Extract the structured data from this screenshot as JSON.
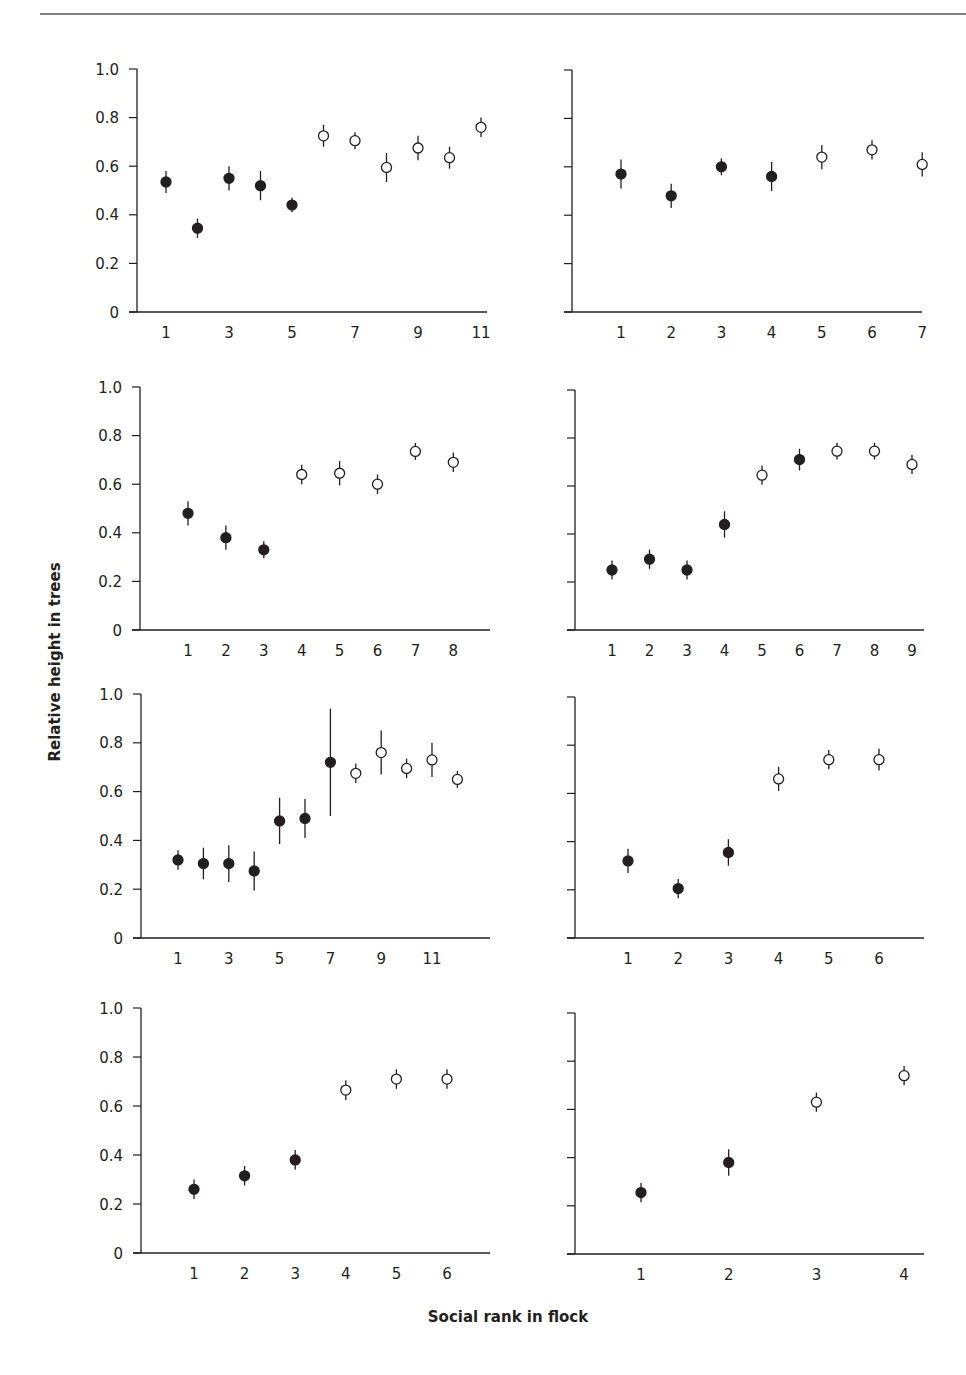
{
  "figure": {
    "ylabel": "Relative height in trees",
    "xlabel": "Social rank in flock",
    "colors": {
      "ink": "#231f20",
      "rule": "#555555",
      "background": "#ffffff"
    },
    "legend_note": "filled = dominant/filled markers, open = open markers"
  },
  "chart_data": [
    {
      "type": "scatter",
      "panel": "top-left",
      "xlabel": "Social rank in flock",
      "ylabel": "Relative height in trees",
      "ylim": [
        0,
        1.0
      ],
      "yticks": [
        "0",
        "0.2",
        "0.4",
        "0.6",
        "0.8",
        "1.0"
      ],
      "show_ytick_labels": true,
      "xtick_labels": [
        "1",
        "3",
        "5",
        "7",
        "9",
        "11"
      ],
      "x": [
        1,
        2,
        3,
        4,
        5,
        6,
        7,
        8,
        9,
        10,
        11
      ],
      "y": [
        0.535,
        0.345,
        0.55,
        0.52,
        0.44,
        0.725,
        0.705,
        0.595,
        0.675,
        0.635,
        0.76
      ],
      "err": [
        0.045,
        0.04,
        0.05,
        0.06,
        0.03,
        0.045,
        0.035,
        0.06,
        0.05,
        0.045,
        0.04
      ],
      "filled": [
        true,
        true,
        true,
        true,
        true,
        false,
        false,
        false,
        false,
        false,
        false
      ],
      "grid": false
    },
    {
      "type": "scatter",
      "panel": "top-right",
      "ylim": [
        0,
        1.0
      ],
      "yticks": [
        "0",
        "0.2",
        "0.4",
        "0.6",
        "0.8",
        "1.0"
      ],
      "show_ytick_labels": false,
      "xtick_labels": [
        "1",
        "2",
        "3",
        "4",
        "5",
        "6",
        "7"
      ],
      "x": [
        1,
        2,
        3,
        4,
        5,
        6,
        7
      ],
      "y": [
        0.57,
        0.48,
        0.6,
        0.56,
        0.64,
        0.67,
        0.61
      ],
      "err": [
        0.06,
        0.05,
        0.035,
        0.06,
        0.05,
        0.04,
        0.05
      ],
      "filled": [
        true,
        true,
        true,
        true,
        false,
        false,
        false
      ],
      "grid": false
    },
    {
      "type": "scatter",
      "panel": "second-left",
      "ylim": [
        0,
        1.0
      ],
      "yticks": [
        "0",
        "0.2",
        "0.4",
        "0.6",
        "0.8",
        "1.0"
      ],
      "show_ytick_labels": true,
      "xtick_labels": [
        "1",
        "2",
        "3",
        "4",
        "5",
        "6",
        "7",
        "8"
      ],
      "x": [
        1,
        2,
        3,
        4,
        5,
        6,
        7,
        8
      ],
      "y": [
        0.48,
        0.38,
        0.33,
        0.64,
        0.645,
        0.6,
        0.735,
        0.69
      ],
      "err": [
        0.05,
        0.05,
        0.035,
        0.04,
        0.05,
        0.04,
        0.035,
        0.04
      ],
      "filled": [
        true,
        true,
        true,
        false,
        false,
        false,
        false,
        false
      ],
      "grid": false
    },
    {
      "type": "scatter",
      "panel": "second-right",
      "ylim": [
        0,
        1.0
      ],
      "yticks": [
        "0",
        "0.2",
        "0.4",
        "0.6",
        "0.8",
        "1.0"
      ],
      "show_ytick_labels": false,
      "xtick_labels": [
        "1",
        "2",
        "3",
        "4",
        "5",
        "6",
        "7",
        "8",
        "9"
      ],
      "x": [
        1,
        2,
        3,
        4,
        5,
        6,
        7,
        8,
        9
      ],
      "y": [
        0.25,
        0.295,
        0.25,
        0.44,
        0.645,
        0.71,
        0.745,
        0.745,
        0.69
      ],
      "err": [
        0.04,
        0.04,
        0.04,
        0.055,
        0.04,
        0.045,
        0.035,
        0.035,
        0.04
      ],
      "filled": [
        true,
        true,
        true,
        true,
        false,
        true,
        false,
        false,
        false
      ],
      "grid": false
    },
    {
      "type": "scatter",
      "panel": "third-left",
      "ylim": [
        0,
        1.0
      ],
      "yticks": [
        "0",
        "0.2",
        "0.4",
        "0.6",
        "0.8",
        "1.0"
      ],
      "show_ytick_labels": true,
      "xtick_labels": [
        "1",
        "3",
        "5",
        "7",
        "9",
        "11"
      ],
      "x": [
        1,
        2,
        3,
        4,
        5,
        6,
        7,
        8,
        9,
        10,
        11,
        12
      ],
      "y": [
        0.32,
        0.305,
        0.305,
        0.275,
        0.48,
        0.49,
        0.72,
        0.675,
        0.76,
        0.695,
        0.73,
        0.65
      ],
      "err": [
        0.04,
        0.065,
        0.075,
        0.08,
        0.095,
        0.08,
        0.22,
        0.04,
        0.09,
        0.04,
        0.07,
        0.035
      ],
      "filled": [
        true,
        true,
        true,
        true,
        true,
        true,
        true,
        false,
        false,
        false,
        false,
        false
      ],
      "grid": false
    },
    {
      "type": "scatter",
      "panel": "third-right",
      "ylim": [
        0,
        1.0
      ],
      "yticks": [
        "0",
        "0.2",
        "0.4",
        "0.6",
        "0.8",
        "1.0"
      ],
      "show_ytick_labels": false,
      "xtick_labels": [
        "1",
        "2",
        "3",
        "4",
        "5",
        "6"
      ],
      "x": [
        1,
        2,
        3,
        4,
        5,
        6
      ],
      "y": [
        0.32,
        0.205,
        0.355,
        0.66,
        0.74,
        0.74
      ],
      "err": [
        0.05,
        0.04,
        0.055,
        0.05,
        0.04,
        0.045
      ],
      "filled": [
        true,
        true,
        true,
        false,
        false,
        false
      ],
      "grid": false
    },
    {
      "type": "scatter",
      "panel": "bottom-left",
      "ylim": [
        0,
        1.0
      ],
      "yticks": [
        "0",
        "0.2",
        "0.4",
        "0.6",
        "0.8",
        "1.0"
      ],
      "show_ytick_labels": true,
      "xtick_labels": [
        "1",
        "2",
        "3",
        "4",
        "5",
        "6"
      ],
      "x": [
        1,
        2,
        3,
        4,
        5,
        6
      ],
      "y": [
        0.26,
        0.315,
        0.38,
        0.665,
        0.71,
        0.71
      ],
      "err": [
        0.04,
        0.04,
        0.04,
        0.04,
        0.04,
        0.04
      ],
      "filled": [
        true,
        true,
        true,
        false,
        false,
        false
      ],
      "grid": false
    },
    {
      "type": "scatter",
      "panel": "bottom-right",
      "ylim": [
        0,
        1.0
      ],
      "yticks": [
        "0",
        "0.2",
        "0.4",
        "0.6",
        "0.8",
        "1.0"
      ],
      "show_ytick_labels": false,
      "xtick_labels": [
        "1",
        "2",
        "3",
        "4"
      ],
      "x": [
        1,
        2,
        3,
        4
      ],
      "y": [
        0.255,
        0.38,
        0.63,
        0.74
      ],
      "err": [
        0.04,
        0.055,
        0.04,
        0.04
      ],
      "filled": [
        true,
        true,
        false,
        false
      ],
      "grid": false
    }
  ],
  "layout": {
    "panels": [
      {
        "axis_x": 137,
        "x_end": 487,
        "y0": 312,
        "y1": 69,
        "first_x": 166,
        "step": 31.5,
        "tick_positions": [
          1,
          3,
          5,
          7,
          9,
          11
        ]
      },
      {
        "axis_x": 572,
        "x_end": 922,
        "y0": 312,
        "y1": 70,
        "first_x": 621,
        "step": 50.2,
        "tick_positions": [
          1,
          2,
          3,
          4,
          5,
          6,
          7
        ]
      },
      {
        "axis_x": 140,
        "x_end": 490,
        "y0": 630,
        "y1": 387,
        "first_x": 188,
        "step": 37.9,
        "tick_positions": [
          1,
          2,
          3,
          4,
          5,
          6,
          7,
          8
        ]
      },
      {
        "axis_x": 575,
        "x_end": 924,
        "y0": 630,
        "y1": 390,
        "first_x": 612,
        "step": 37.5,
        "tick_positions": [
          1,
          2,
          3,
          4,
          5,
          6,
          7,
          8,
          9
        ]
      },
      {
        "axis_x": 141,
        "x_end": 490,
        "y0": 938,
        "y1": 694,
        "first_x": 178,
        "step": 25.4,
        "tick_positions": [
          1,
          3,
          5,
          7,
          9,
          11
        ]
      },
      {
        "axis_x": 575,
        "x_end": 924,
        "y0": 938,
        "y1": 697,
        "first_x": 628,
        "step": 50.2,
        "tick_positions": [
          1,
          2,
          3,
          4,
          5,
          6
        ]
      },
      {
        "axis_x": 141,
        "x_end": 490,
        "y0": 1253,
        "y1": 1008,
        "first_x": 194,
        "step": 50.6,
        "tick_positions": [
          1,
          2,
          3,
          4,
          5,
          6
        ]
      },
      {
        "axis_x": 575,
        "x_end": 924,
        "y0": 1254,
        "y1": 1013,
        "first_x": 641,
        "step": 87.7,
        "tick_positions": [
          1,
          2,
          3,
          4
        ]
      }
    ]
  }
}
